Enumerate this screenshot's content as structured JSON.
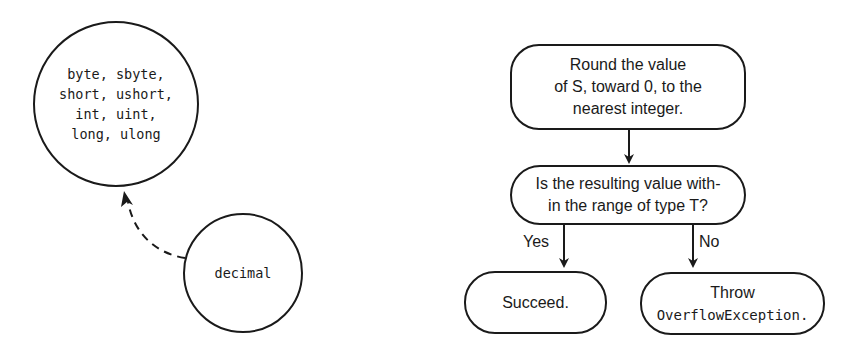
{
  "left_diagram": {
    "target_node": {
      "lines": [
        "byte, sbyte,",
        "short, ushort,",
        "int, uint,",
        "long, ulong"
      ]
    },
    "source_node": {
      "label": "decimal"
    },
    "conversion_arrow": {
      "style": "dashed",
      "direction": "decimal -> integral types"
    }
  },
  "flowchart": {
    "step_round": {
      "lines": [
        "Round the value",
        "of S, toward 0, to the",
        "nearest integer."
      ]
    },
    "decision_range": {
      "lines": [
        "Is the resulting value with-",
        "in the range of type T?"
      ]
    },
    "branch_yes": {
      "label": "Yes"
    },
    "branch_no": {
      "label": "No"
    },
    "outcome_succeed": {
      "label": "Succeed."
    },
    "outcome_throw": {
      "line1": "Throw",
      "line2": "OverflowException."
    }
  },
  "colors": {
    "stroke": "#1a1a1a",
    "background": "#ffffff"
  }
}
